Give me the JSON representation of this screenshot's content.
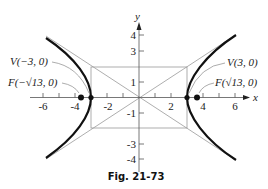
{
  "figure": {
    "caption": "Fig. 21-73",
    "axes": {
      "x_label": "x",
      "y_label": "y",
      "x_ticks": [
        "-6",
        "-4",
        "-2",
        "2",
        "4",
        "6"
      ],
      "y_ticks": [
        "4",
        "3",
        "1",
        "-1",
        "-3",
        "-4"
      ]
    },
    "annotations": {
      "vertex_left": "V(−3, 0)",
      "vertex_right": "V(3, 0)",
      "focus_left": "F(−√13, 0)",
      "focus_right": "F(√13, 0)"
    },
    "hyperbola": {
      "equation": "x^2/9 - y^2/4 = 1",
      "a": 3,
      "b": 2,
      "c": "sqrt(13)",
      "asymptotes": [
        "y = 2x/3",
        "y = -2x/3"
      ],
      "fundamental_rectangle": {
        "x": [
          -3,
          3
        ],
        "y": [
          -2,
          2
        ]
      }
    },
    "colors": {
      "curve": "#111111",
      "guide_lines": "#999999",
      "axis": "#555555"
    }
  }
}
